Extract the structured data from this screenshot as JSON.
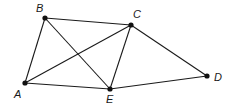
{
  "diagram": {
    "type": "graph",
    "vertices": [
      {
        "id": "A",
        "label": "A",
        "x": 25,
        "y": 83,
        "lx": 14,
        "ly": 98
      },
      {
        "id": "B",
        "label": "B",
        "x": 45,
        "y": 18,
        "lx": 36,
        "ly": 12
      },
      {
        "id": "C",
        "label": "C",
        "x": 131,
        "y": 25,
        "lx": 133,
        "ly": 18
      },
      {
        "id": "D",
        "label": "D",
        "x": 207,
        "y": 76,
        "lx": 214,
        "ly": 81
      },
      {
        "id": "E",
        "label": "E",
        "x": 110,
        "y": 89,
        "lx": 106,
        "ly": 103
      }
    ],
    "edges": [
      [
        "A",
        "B"
      ],
      [
        "B",
        "C"
      ],
      [
        "B",
        "E"
      ],
      [
        "A",
        "C"
      ],
      [
        "A",
        "E"
      ],
      [
        "C",
        "E"
      ],
      [
        "C",
        "D"
      ],
      [
        "E",
        "D"
      ]
    ]
  }
}
